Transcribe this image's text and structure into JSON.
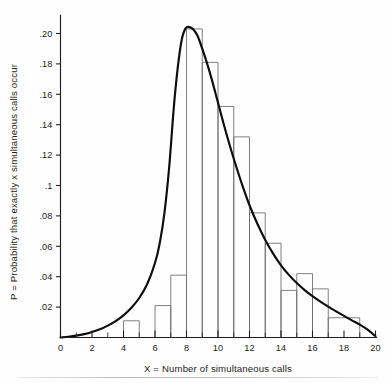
{
  "figure": {
    "background_color": "#fefefe",
    "curve_color": "#0d0d0d",
    "bar_stroke_color": "#6a6a6a",
    "axis_color": "#202020"
  },
  "chart_data": {
    "type": "bar",
    "title": "",
    "subtitle": "",
    "xlabel": "X = Number of simultaneous calls",
    "ylabel": "P = Probability that exactly x simultaneous calls occur",
    "xlim": [
      0,
      20
    ],
    "ylim": [
      0,
      0.212
    ],
    "grid": false,
    "legend": null,
    "x_tick_labels": [
      "0",
      "2",
      "4",
      "6",
      "8",
      "10",
      "12",
      "14",
      "16",
      "18",
      "20"
    ],
    "x_tick_values": [
      0,
      2,
      4,
      6,
      8,
      10,
      12,
      14,
      16,
      18,
      20
    ],
    "x_minor_tick_values": [
      1,
      3,
      5,
      7,
      9,
      11,
      13,
      15,
      17,
      19
    ],
    "y_tick_labels": [
      ".02",
      ".04",
      ".06",
      ".08",
      ".1",
      ".12",
      ".14",
      ".16",
      ".18",
      ".20"
    ],
    "y_tick_values": [
      0.02,
      0.04,
      0.06,
      0.08,
      0.1,
      0.12,
      0.14,
      0.16,
      0.18,
      0.2
    ],
    "bars": [
      {
        "x_start": 4,
        "x_end": 5,
        "value": 0.011
      },
      {
        "x_start": 6,
        "x_end": 7,
        "value": 0.021
      },
      {
        "x_start": 7,
        "x_end": 8,
        "value": 0.041
      },
      {
        "x_start": 8,
        "x_end": 9,
        "value": 0.203
      },
      {
        "x_start": 9,
        "x_end": 10,
        "value": 0.181
      },
      {
        "x_start": 10,
        "x_end": 11,
        "value": 0.152
      },
      {
        "x_start": 11,
        "x_end": 12,
        "value": 0.132
      },
      {
        "x_start": 12,
        "x_end": 13,
        "value": 0.082
      },
      {
        "x_start": 13,
        "x_end": 14,
        "value": 0.062
      },
      {
        "x_start": 14,
        "x_end": 15,
        "value": 0.031
      },
      {
        "x_start": 15,
        "x_end": 16,
        "value": 0.042
      },
      {
        "x_start": 16,
        "x_end": 17,
        "value": 0.032
      },
      {
        "x_start": 17,
        "x_end": 19,
        "value": 0.013
      }
    ],
    "curve": {
      "name": "smoothed probability density",
      "x": [
        0.0,
        0.5,
        1.0,
        1.5,
        2.0,
        2.5,
        3.0,
        3.5,
        4.0,
        4.5,
        5.0,
        5.5,
        6.0,
        6.3,
        6.6,
        6.9,
        7.2,
        7.45,
        7.7,
        7.95,
        8.2,
        8.45,
        8.7,
        9.0,
        9.3,
        9.6,
        10.0,
        10.4,
        10.8,
        11.2,
        11.6,
        12.0,
        12.5,
        13.0,
        13.5,
        14.0,
        14.5,
        15.0,
        15.5,
        16.0,
        16.5,
        17.0,
        17.5,
        18.0,
        18.5,
        19.0,
        19.5,
        20.0
      ],
      "y": [
        0.0,
        0.0005,
        0.0012,
        0.0022,
        0.0036,
        0.0054,
        0.0078,
        0.0108,
        0.0146,
        0.0196,
        0.026,
        0.035,
        0.049,
        0.062,
        0.082,
        0.112,
        0.152,
        0.178,
        0.196,
        0.2035,
        0.2042,
        0.2025,
        0.1985,
        0.19,
        0.1805,
        0.17,
        0.1545,
        0.139,
        0.1245,
        0.111,
        0.0985,
        0.087,
        0.0748,
        0.0642,
        0.0552,
        0.0475,
        0.0412,
        0.0358,
        0.0312,
        0.0272,
        0.0236,
        0.0203,
        0.0172,
        0.0142,
        0.0113,
        0.0085,
        0.0052,
        0.0008
      ]
    }
  }
}
